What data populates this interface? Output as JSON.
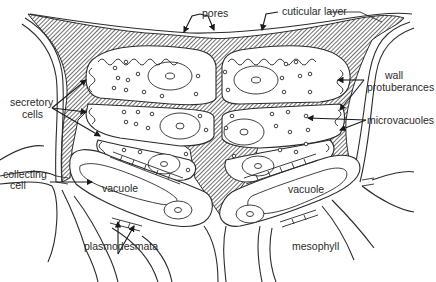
{
  "figure": {
    "type": "biological cross-section diagram"
  },
  "labels": {
    "pores": "pores",
    "cuticular_layer": "cuticular layer",
    "secretory_cells_1": "secretory",
    "secretory_cells_2": "cells",
    "wall_protuberances_1": "wall",
    "wall_protuberances_2": "protuberances",
    "microvacuoles": "microvacuoles",
    "collecting_cell_1": "collecting",
    "collecting_cell_2": "cell",
    "vacuole_left": "vacuole",
    "vacuole_right": "vacuole",
    "plasmodesmata": "plasmodesmata",
    "mesophyll": "mesophyll"
  },
  "colors": {
    "line": "#2b2b2b",
    "background": "#ffffff",
    "text": "#2a2a2a"
  }
}
